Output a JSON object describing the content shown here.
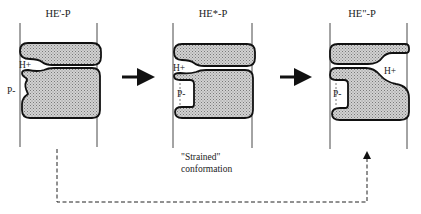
{
  "diagram": {
    "type": "enzyme conformational change schematic",
    "panels": [
      {
        "title": "HE'-P",
        "h_plus_label": "H+",
        "p_label": "P-",
        "state": "initial"
      },
      {
        "title": "HE*-P",
        "h_plus_label": "H+",
        "p_label": "P-",
        "state": "strained",
        "caption_line1": "\"Strained\"",
        "caption_line2": "conformation"
      },
      {
        "title": "HE\"-P",
        "h_plus_label": "H+",
        "p_label": "P-",
        "state": "final"
      }
    ],
    "arrows": [
      {
        "from": "panel-1",
        "to": "panel-2",
        "style": "solid"
      },
      {
        "from": "panel-2",
        "to": "panel-3",
        "style": "solid"
      },
      {
        "from": "panel-1",
        "to": "panel-3",
        "style": "dashed"
      }
    ],
    "colors": {
      "outline": "#111111",
      "fill": "#b8b8b8",
      "background": "#ffffff"
    }
  }
}
